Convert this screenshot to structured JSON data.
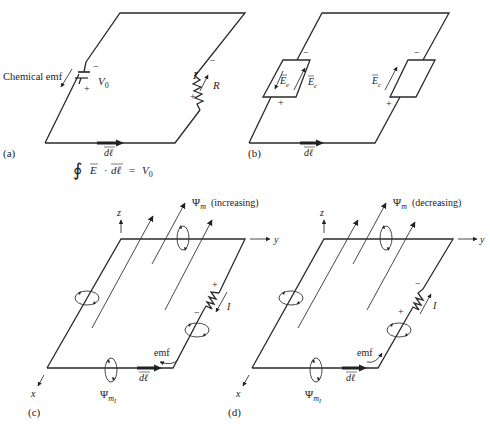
{
  "figure": {
    "panels": {
      "a": {
        "label": "(a)",
        "source_label": "Chemical emf",
        "voltage_label": "V",
        "voltage_sub": "0",
        "current_label": "I",
        "resistor_label": "R",
        "minus": "−",
        "plus": "+",
        "path_element": "dℓ",
        "equation": {
          "integral": "∮",
          "lhs_field": "E",
          "dot": "·",
          "lhs_path": "dℓ",
          "equals": "=",
          "rhs": "V",
          "rhs_sub": "0"
        }
      },
      "b": {
        "label": "(b)",
        "field_e_label": "E",
        "field_e_sub": "e",
        "field_c_label": "E",
        "field_c_sub": "c",
        "minus": "−",
        "plus": "+",
        "path_element": "dℓ"
      },
      "c": {
        "label": "(c)",
        "flux_label": "Ψ",
        "flux_sub": "m",
        "flux_state": "(increasing)",
        "induced_flux_label": "Ψ",
        "induced_flux_sub": "m",
        "induced_flux_subsub": "I",
        "current_label": "I",
        "emf_label": "emf",
        "axis_x": "x",
        "axis_y": "y",
        "axis_z": "z",
        "minus": "−",
        "plus": "+",
        "path_element": "dℓ"
      },
      "d": {
        "label": "(d)",
        "flux_label": "Ψ",
        "flux_sub": "m",
        "flux_state": "(decreasing)",
        "induced_flux_label": "Ψ",
        "induced_flux_sub": "m",
        "induced_flux_subsub": "I",
        "current_label": "I",
        "emf_label": "emf",
        "axis_x": "x",
        "axis_y": "y",
        "axis_z": "z",
        "minus": "−",
        "plus": "+",
        "path_element": "dℓ"
      }
    }
  }
}
